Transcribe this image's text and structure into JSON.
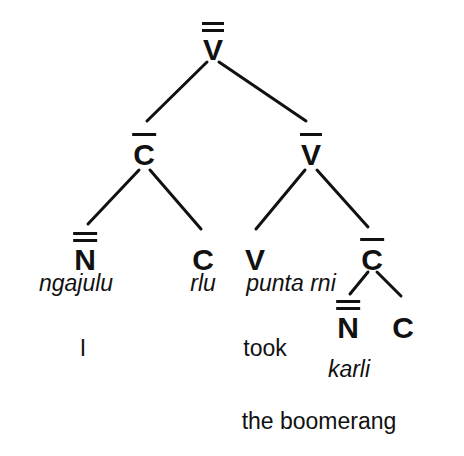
{
  "diagram": {
    "type": "syntax-tree",
    "title": "",
    "language_example": "ngajulu rlu punta rni karli",
    "gloss_line": "I took the boomerang",
    "ink_color": "#111111",
    "background_color": "#ffffff"
  },
  "nodes": {
    "root": {
      "label": "V",
      "bars": 2,
      "x": 213,
      "y": 35
    },
    "cbar": {
      "label": "C",
      "bars": 1,
      "x": 144,
      "y": 140
    },
    "vbar": {
      "label": "V",
      "bars": 1,
      "x": 311,
      "y": 140
    },
    "nbarbar": {
      "label": "N",
      "bars": 2,
      "x": 85,
      "y": 245
    },
    "c_leaf_left": {
      "label": "C",
      "bars": 0,
      "x": 203,
      "y": 245
    },
    "v_leaf": {
      "label": "V",
      "bars": 0,
      "x": 255,
      "y": 245
    },
    "cbar_right": {
      "label": "C",
      "bars": 1,
      "x": 372,
      "y": 245
    },
    "nbarbar_right": {
      "label": "N",
      "bars": 2,
      "x": 348,
      "y": 313
    },
    "c_leaf_right": {
      "label": "C",
      "bars": 0,
      "x": 403,
      "y": 313
    }
  },
  "words": [
    {
      "text": "ngajulu",
      "x": 76,
      "y": 272
    },
    {
      "text": "rlu",
      "x": 203,
      "y": 272
    },
    {
      "text": "punta rni",
      "x": 291,
      "y": 272
    },
    {
      "text": "karli",
      "x": 349,
      "y": 358
    }
  ],
  "glosses": [
    {
      "text": "I",
      "x": 83,
      "y": 337
    },
    {
      "text": "took",
      "x": 265,
      "y": 337
    },
    {
      "text": "the boomerang",
      "x": 319,
      "y": 410
    }
  ],
  "edges": [
    {
      "from": "root",
      "to": "cbar"
    },
    {
      "from": "root",
      "to": "vbar"
    },
    {
      "from": "cbar",
      "to": "nbarbar"
    },
    {
      "from": "cbar",
      "to": "c_leaf_left"
    },
    {
      "from": "vbar",
      "to": "v_leaf"
    },
    {
      "from": "vbar",
      "to": "cbar_right"
    },
    {
      "from": "cbar_right",
      "to": "nbarbar_right"
    },
    {
      "from": "cbar_right",
      "to": "c_leaf_right"
    }
  ]
}
